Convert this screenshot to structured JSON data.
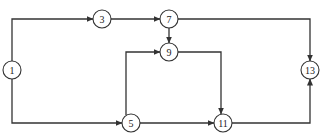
{
  "diagram": {
    "type": "activity-network",
    "nodes": [
      {
        "id": "1",
        "label": "1",
        "x": 12,
        "y": 70
      },
      {
        "id": "3",
        "label": "3",
        "x": 102,
        "y": 19
      },
      {
        "id": "7",
        "label": "7",
        "x": 169,
        "y": 19
      },
      {
        "id": "9",
        "label": "9",
        "x": 169,
        "y": 52
      },
      {
        "id": "5",
        "label": "5",
        "x": 131,
        "y": 123
      },
      {
        "id": "11",
        "label": "11",
        "x": 223,
        "y": 123
      },
      {
        "id": "13",
        "label": "13",
        "x": 310,
        "y": 70
      }
    ],
    "edges": [
      {
        "from": "1",
        "to": "3"
      },
      {
        "from": "1",
        "to": "5"
      },
      {
        "from": "3",
        "to": "7"
      },
      {
        "from": "7",
        "to": "9"
      },
      {
        "from": "7",
        "to": "13"
      },
      {
        "from": "5",
        "to": "9"
      },
      {
        "from": "5",
        "to": "11"
      },
      {
        "from": "9",
        "to": "11"
      },
      {
        "from": "11",
        "to": "13"
      }
    ],
    "colors": {
      "line": "#333333",
      "background": "#ffffff"
    }
  }
}
